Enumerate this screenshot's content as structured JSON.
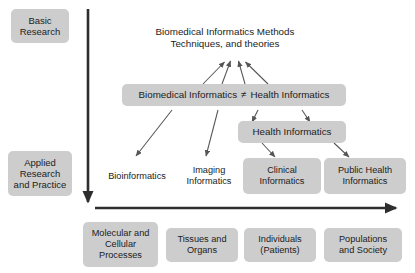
{
  "figure": {
    "title": "Biomedical Informatics Methods Techniques, and theories",
    "background_color": "#ffffff",
    "box_fill_color": "#cdcdcd",
    "text_color": "#1c1c1c",
    "arrow_color": "#555555",
    "axis_color": "#333333"
  },
  "axes": {
    "vertical": {
      "name": "research-translation-axis",
      "top_label": "Basic\nResearch",
      "bottom_label": "Applied\nResearch\nand Practice",
      "arrow_direction": "down"
    },
    "horizontal": {
      "name": "biological-scale-axis",
      "arrow_direction": "right"
    }
  },
  "nodes": {
    "title_node": "Biomedical Informatics Methods\nTechniques, and theories",
    "middle_left": "Biomedical Informatics",
    "middle_operator": "≠",
    "middle_right": "Health Informatics",
    "health_informatics": "Health Informatics",
    "bioinformatics": "Bioinformatics",
    "imaging_informatics": "Imaging\nInformatics",
    "clinical_informatics": "Clinical\nInformatics",
    "public_health_informatics": "Public Health\nInformatics"
  },
  "scale_boxes": [
    {
      "label": "Molecular and\nCellular\nProcesses"
    },
    {
      "label": "Tissues and\nOrgans"
    },
    {
      "label": "Individuals\n(Patients)"
    },
    {
      "label": "Populations\nand Society"
    }
  ]
}
